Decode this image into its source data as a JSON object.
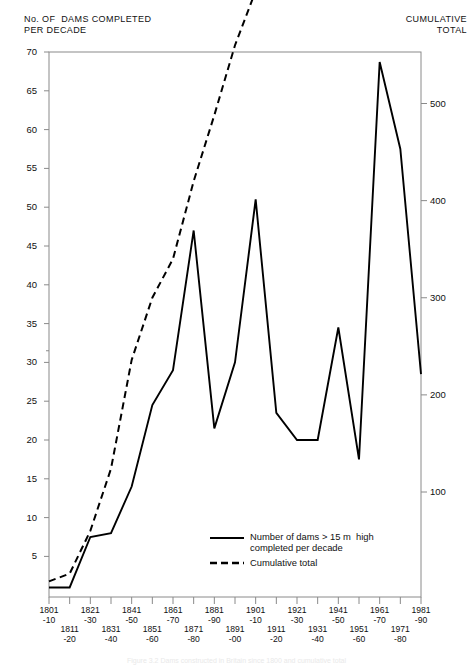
{
  "chart_data": {
    "type": "line",
    "title": "",
    "ylabel_left": "No. OF  DAMS COMPLETED\nPER DECADE",
    "ylabel_right": "CUMULATIVE\nTOTAL",
    "xlabel": "",
    "grid": false,
    "legend_position": "inside-bottom-center",
    "x_top_labels": [
      "1801\n-10",
      "1821\n-30",
      "1841\n-50",
      "1861\n-70",
      "1881\n-90",
      "1901\n-10",
      "1921\n-30",
      "1941\n-50",
      "1961\n-70",
      "1981\n-90"
    ],
    "x_bottom_labels": [
      "1811\n-20",
      "1831\n-40",
      "1851\n-60",
      "1871\n-80",
      "1891\n-00",
      "1911\n-20",
      "1931\n-40",
      "1951\n-60",
      "1971\n-80"
    ],
    "categories": [
      "1801-10",
      "1811-20",
      "1821-30",
      "1831-40",
      "1841-50",
      "1851-60",
      "1861-70",
      "1871-80",
      "1881-90",
      "1891-00",
      "1901-10",
      "1911-20",
      "1921-30",
      "1931-40",
      "1941-50",
      "1951-60",
      "1961-70",
      "1971-80",
      "1981-90"
    ],
    "ylim_left": [
      0,
      70
    ],
    "ylim_right": [
      0,
      560
    ],
    "yticks_left": [
      5,
      10,
      15,
      20,
      25,
      30,
      35,
      40,
      45,
      50,
      55,
      60,
      65,
      70
    ],
    "yticks_right": [
      100,
      200,
      300,
      400,
      500
    ],
    "series": [
      {
        "name": "Number of dams >15 m high completed per decade",
        "style": "solid",
        "axis": "left",
        "values": [
          1,
          1,
          7.5,
          8,
          14,
          24.5,
          29,
          47,
          21.5,
          30,
          51,
          23.5,
          20,
          20,
          34.5,
          17.5,
          68.7,
          57.5,
          28.5
        ]
      },
      {
        "name": "Cumulative total",
        "style": "dashed",
        "axis": "right",
        "values": [
          8,
          16,
          60,
          124,
          236,
          300,
          340,
          420,
          488,
          560,
          616,
          660,
          700,
          740,
          800,
          840,
          1000,
          1060,
          1120
        ]
      }
    ],
    "cumulative_plotted_left_equivalent": [
      1,
      2,
      7.5,
      15.5,
      29.5,
      37.5,
      42.5,
      52.5,
      61,
      70,
      77,
      82.5,
      87.5,
      92.5,
      100,
      105,
      125,
      132.5,
      140
    ],
    "legend": [
      {
        "label": "Number of dams > 15 m  high\ncompleted per decade",
        "style": "solid"
      },
      {
        "label": "Cumulative total",
        "style": "dashed"
      }
    ],
    "colors": {
      "line": "#000000",
      "axis": "#808080",
      "text": "#111111"
    }
  },
  "caption": "Figure 3.2 Dams constructed in Britain since 1800 and cumulative total"
}
